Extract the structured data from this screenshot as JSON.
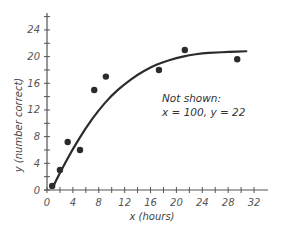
{
  "chart_data": {
    "type": "scatter",
    "title": "",
    "xlabel": "x (hours)",
    "ylabel": "y (number correct)",
    "xlim": [
      0,
      33
    ],
    "ylim": [
      0,
      26
    ],
    "xticks": [
      0,
      4,
      8,
      12,
      16,
      20,
      24,
      28,
      32
    ],
    "yticks": [
      0,
      4,
      8,
      12,
      16,
      20,
      24
    ],
    "grid": false,
    "legend": null,
    "series": [
      {
        "name": "data points",
        "kind": "scatter",
        "x": [
          0.8,
          2,
          3.2,
          5.1,
          7.3,
          9.1,
          17.3,
          21.3,
          29.4
        ],
        "y": [
          0.6,
          3,
          7.2,
          6,
          15,
          17,
          18,
          21,
          19.6
        ]
      },
      {
        "name": "fitted curve",
        "kind": "line",
        "x": [
          1,
          2,
          4,
          6,
          8,
          10,
          12,
          14,
          16,
          18,
          20,
          22,
          24,
          26,
          28,
          30.8
        ],
        "y": [
          0.6,
          2.6,
          6.2,
          9.3,
          12.0,
          14.2,
          15.9,
          17.3,
          18.4,
          19.2,
          19.8,
          20.2,
          20.5,
          20.6,
          20.7,
          20.8
        ]
      }
    ],
    "annotations": [
      {
        "text_line1": "Not shown:",
        "text_line2": "x = 100, y = 22"
      }
    ]
  },
  "labels": {
    "xlabel": "x (hours)",
    "ylabel": "y (number correct)",
    "note_line1": "Not shown:",
    "note_line2": "x = 100, y = 22"
  },
  "colors": {
    "axis": "#555555",
    "points": "#2b2b2b",
    "curve": "#2b2b2b"
  }
}
